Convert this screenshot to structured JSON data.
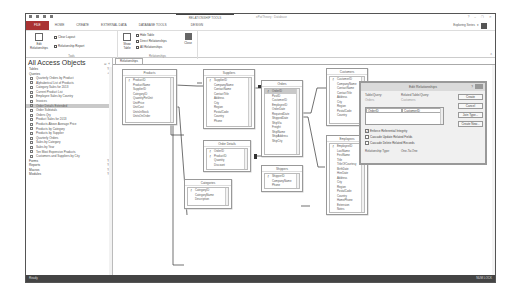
{
  "titlebar": {
    "context_group": "RELATIONSHIP TOOLS",
    "app_title": "ePatTheory : Database",
    "controls": [
      "?",
      "–",
      "❐",
      "✕"
    ]
  },
  "ribbon_tabs": [
    "FILE",
    "HOME",
    "CREATE",
    "EXTERNAL DATA",
    "DATABASE TOOLS",
    "DESIGN"
  ],
  "user": {
    "name": "Exploring Series"
  },
  "ribbon": {
    "tools_group": {
      "label": "Tools",
      "edit_relationships": "Edit Relationships",
      "clear_layout": "Clear Layout",
      "relationship_report": "Relationship Report"
    },
    "relationships_group": {
      "label": "Relationships",
      "show_table": "Show Table",
      "hide_table": "Hide Table",
      "direct_relationships": "Direct Relationships",
      "all_relationships": "All Relationships",
      "close": "Close"
    }
  },
  "nav": {
    "title": "All Access Objects",
    "sections": {
      "tables": "Tables",
      "queries": "Queries",
      "forms": "Forms",
      "reports": "Reports",
      "macros": "Macros",
      "modules": "Modules"
    },
    "queries": [
      "Quarterly Orders by Product",
      "Alphabetical List of Products",
      "Category Sales for 2013",
      "Current Product List",
      "Employee Sales by Country",
      "Invoices",
      "Order Details Extended",
      "Order Subtotals",
      "Orders Qry",
      "Product Sales for 2013",
      "Products Above Average Price",
      "Products by Category",
      "Products by Supplier",
      "Quarterly Orders",
      "Sales by Category",
      "Sales by Year",
      "Ten Most Expensive Products",
      "Customers and Suppliers by City"
    ],
    "selected_index": 6
  },
  "document": {
    "tab": "Relationships"
  },
  "tables": {
    "products": {
      "title": "Products",
      "fields": [
        "ProductID",
        "ProductName",
        "SupplierID",
        "CategoryID",
        "QuantityPerUnit",
        "UnitPrice",
        "UnitCost",
        "UnitsInStock",
        "UnitsOnOrder"
      ]
    },
    "suppliers": {
      "title": "Suppliers",
      "fields": [
        "SupplierID",
        "CompanyName",
        "ContactName",
        "ContactTitle",
        "Address",
        "City",
        "Region",
        "PostalCode",
        "Country",
        "Phone"
      ]
    },
    "orders": {
      "title": "Orders",
      "fields": [
        "OrderID",
        "PostID",
        "CustomerID",
        "EmployeeID",
        "OrderDate",
        "RequiredDate",
        "ShippedDate",
        "ShipVia",
        "Freight",
        "ShipName",
        "ShipAddress",
        "ShipCity"
      ]
    },
    "customers": {
      "title": "Customers",
      "fields": [
        "CustomerID",
        "CompanyName",
        "ContactName",
        "ContactTitle",
        "Address",
        "City",
        "Region",
        "PostalCode",
        "Country"
      ]
    },
    "order_details": {
      "title": "Order Details",
      "fields": [
        "OrderID",
        "ProductID",
        "Quantity",
        "Discount"
      ]
    },
    "categories": {
      "title": "Categories",
      "fields": [
        "CategoryID",
        "CategoryName",
        "Description"
      ]
    },
    "shippers": {
      "title": "Shippers",
      "fields": [
        "ShipperID",
        "CompanyName",
        "Phone"
      ]
    },
    "employees": {
      "title": "Employees",
      "fields": [
        "EmployeeID",
        "LastName",
        "FirstName",
        "Title",
        "TitleOfCourtesy",
        "BirthDate",
        "HireDate",
        "Address",
        "City",
        "Region",
        "PostalCode",
        "Country",
        "HomePhone",
        "Extension",
        "Notes"
      ]
    }
  },
  "dialog": {
    "title": "Edit Relationships",
    "help": "?",
    "table_label": "Table/Query:",
    "related_label": "Related Table/Query:",
    "table_value": "Orders",
    "related_value": "Customers",
    "field_left": "OrderID",
    "field_right": "CustomerID",
    "buttons": {
      "create": "Create",
      "cancel": "Cancel",
      "join_type": "Join Type...",
      "create_new": "Create New..."
    },
    "checks": [
      {
        "label": "Enforce Referential Integrity",
        "checked": true
      },
      {
        "label": "Cascade Update Related Fields",
        "checked": false
      },
      {
        "label": "Cascade Delete Related Records",
        "checked": false
      }
    ],
    "rel_type_label": "Relationship Type:",
    "rel_type_value": "One-To-One"
  },
  "status": {
    "left": "Ready",
    "right": "NUM LOCK"
  }
}
